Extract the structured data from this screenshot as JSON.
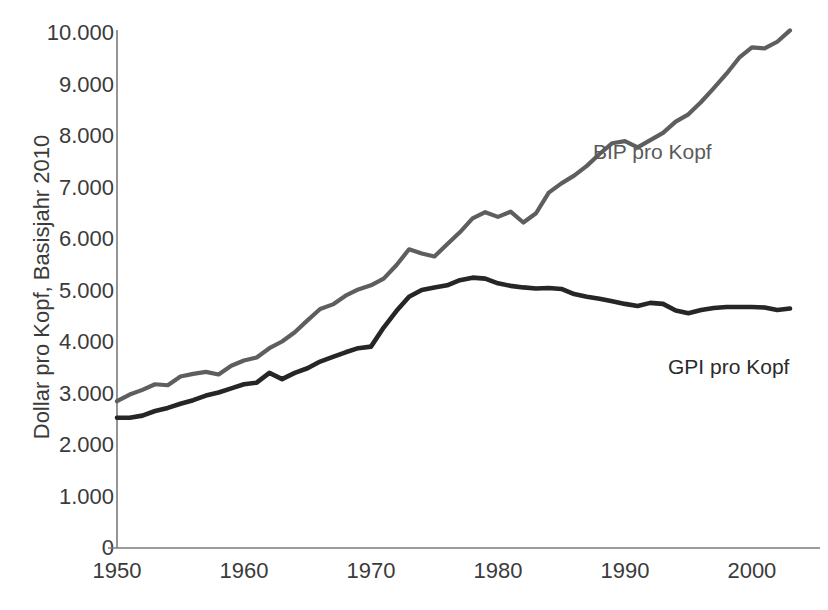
{
  "chart_data": {
    "type": "line",
    "title": "",
    "xlabel": "",
    "ylabel": "Dollar pro Kopf, Basisjahr 2010",
    "xlim": [
      1950,
      2003
    ],
    "ylim": [
      0,
      10000
    ],
    "grid": false,
    "legend_position": "inline-annotations",
    "y_ticks": [
      "10.000",
      "9.000",
      "8.000",
      "7.000",
      "6.000",
      "5.000",
      "4.000",
      "3.000",
      "2.000",
      "1.000",
      "0"
    ],
    "y_tick_values": [
      10000,
      9000,
      8000,
      7000,
      6000,
      5000,
      4000,
      3000,
      2000,
      1000,
      0
    ],
    "x_ticks": [
      "1950",
      "1960",
      "1970",
      "1980",
      "1990",
      "2000"
    ],
    "x_tick_values": [
      1950,
      1960,
      1970,
      1980,
      1990,
      2000
    ],
    "x": [
      1950,
      1951,
      1952,
      1953,
      1954,
      1955,
      1956,
      1957,
      1958,
      1959,
      1960,
      1961,
      1962,
      1963,
      1964,
      1965,
      1966,
      1967,
      1968,
      1969,
      1970,
      1971,
      1972,
      1973,
      1974,
      1975,
      1976,
      1977,
      1978,
      1979,
      1980,
      1981,
      1982,
      1983,
      1984,
      1985,
      1986,
      1987,
      1988,
      1989,
      1990,
      1991,
      1992,
      1993,
      1994,
      1995,
      1996,
      1997,
      1998,
      1999,
      2000,
      2001,
      2002,
      2003
    ],
    "series": [
      {
        "name": "BIP pro Kopf",
        "color": "#5e5e5e",
        "label_annotation": "BIP pro Kopf",
        "values": [
          2850,
          2980,
          3070,
          3180,
          3160,
          3330,
          3380,
          3420,
          3370,
          3540,
          3640,
          3700,
          3880,
          4010,
          4190,
          4420,
          4640,
          4730,
          4900,
          5020,
          5100,
          5230,
          5490,
          5800,
          5720,
          5660,
          5900,
          6130,
          6400,
          6520,
          6430,
          6530,
          6320,
          6500,
          6900,
          7080,
          7230,
          7420,
          7650,
          7860,
          7900,
          7780,
          7920,
          8060,
          8280,
          8420,
          8660,
          8930,
          9210,
          9520,
          9720,
          9700,
          9830,
          10050
        ]
      },
      {
        "name": "GPI pro Kopf",
        "color": "#262626",
        "label_annotation": "GPI pro Kopf",
        "values": [
          2530,
          2530,
          2570,
          2660,
          2720,
          2800,
          2870,
          2960,
          3020,
          3100,
          3180,
          3210,
          3400,
          3280,
          3400,
          3490,
          3620,
          3710,
          3800,
          3880,
          3910,
          4280,
          4600,
          4880,
          5010,
          5060,
          5100,
          5200,
          5250,
          5230,
          5140,
          5090,
          5060,
          5040,
          5050,
          5030,
          4930,
          4880,
          4840,
          4790,
          4740,
          4700,
          4760,
          4740,
          4610,
          4560,
          4620,
          4660,
          4680,
          4680,
          4680,
          4670,
          4620,
          4650
        ]
      }
    ],
    "annotations": [
      {
        "text": "BIP pro Kopf",
        "x_px": 593,
        "y_px": 140
      },
      {
        "text": "GPI pro Kopf",
        "x_px": 668,
        "y_px": 355
      }
    ]
  },
  "axis": {
    "y_title": "Dollar pro Kopf, Basisjahr 2010"
  }
}
